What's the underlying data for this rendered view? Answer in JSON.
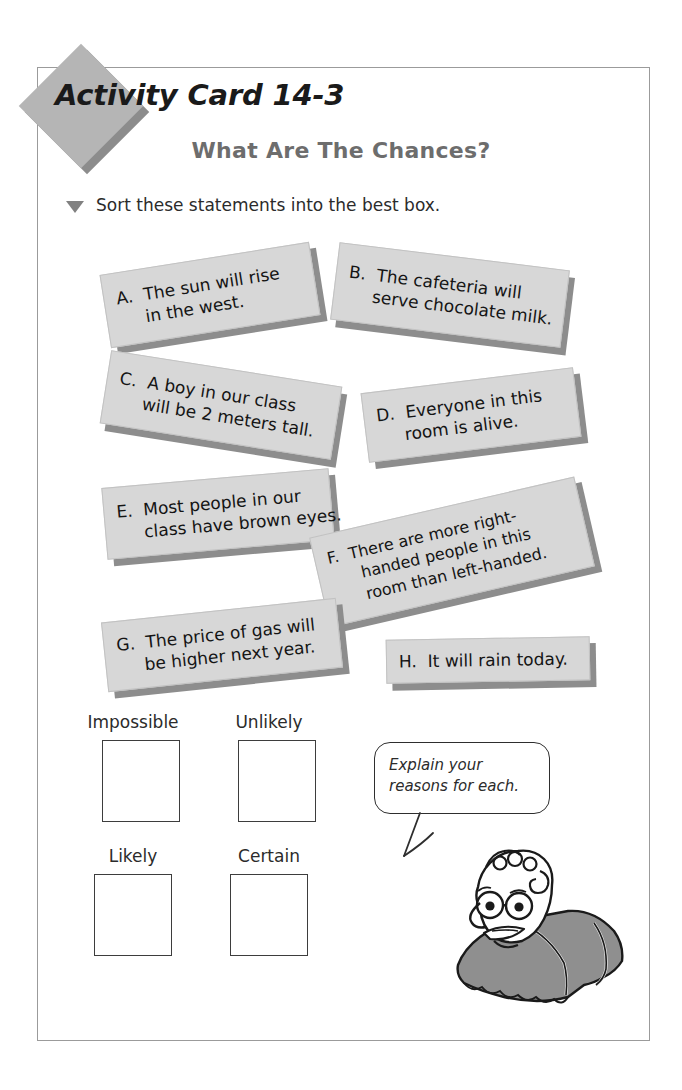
{
  "page": {
    "badge_title": "Activity Card 14-3",
    "headline": "What Are The Chances?",
    "instruction": "Sort these statements into the best box.",
    "bullet_icon": "triangle-down-icon"
  },
  "statements": [
    {
      "id": "a",
      "letter": "A.",
      "lines": [
        "The sun will rise",
        "in the west."
      ],
      "text": "The sun will rise in the west."
    },
    {
      "id": "b",
      "letter": "B.",
      "lines": [
        "The cafeteria will",
        "serve chocolate milk."
      ],
      "text": "The cafeteria will serve chocolate milk."
    },
    {
      "id": "c",
      "letter": "C.",
      "lines": [
        "A boy in our class",
        "will be 2 meters tall."
      ],
      "text": "A boy in our class will be 2 meters tall."
    },
    {
      "id": "d",
      "letter": "D.",
      "lines": [
        "Everyone in this",
        "room is alive."
      ],
      "text": "Everyone in this room is alive."
    },
    {
      "id": "e",
      "letter": "E.",
      "lines": [
        "Most people in our",
        "class have brown eyes."
      ],
      "text": "Most people in our class have brown eyes."
    },
    {
      "id": "f",
      "letter": "F.",
      "lines": [
        "There are more right-",
        "handed people in this",
        "room than left-handed."
      ],
      "text": "There are more right-handed people in this room than left-handed."
    },
    {
      "id": "g",
      "letter": "G.",
      "lines": [
        "The price of gas will",
        "be higher next year."
      ],
      "text": "The price of gas will be higher next year."
    },
    {
      "id": "h",
      "letter": "H.",
      "lines": [
        "It will rain today."
      ],
      "text": "It will rain today."
    }
  ],
  "sort_boxes": [
    {
      "id": "impossible",
      "label": "Impossible",
      "value": ""
    },
    {
      "id": "unlikely",
      "label": "Unlikely",
      "value": ""
    },
    {
      "id": "likely",
      "label": "Likely",
      "value": ""
    },
    {
      "id": "certain",
      "label": "Certain",
      "value": ""
    }
  ],
  "speech_bubble": {
    "lines": [
      "Explain your",
      "reasons for each."
    ],
    "text": "Explain your reasons for each."
  },
  "illustration": {
    "name": "cartoon-teacher-with-glasses",
    "shirt_color": "#8f8f8f"
  },
  "colors": {
    "card_fill": "#d7d7d7",
    "card_shadow": "#8d8d8d",
    "badge_fill": "#b5b5b5",
    "badge_shadow": "#8c8c8c",
    "headline_gray": "#6d6d6d",
    "frame_border": "#9b9b9b",
    "ink": "#231f20"
  }
}
